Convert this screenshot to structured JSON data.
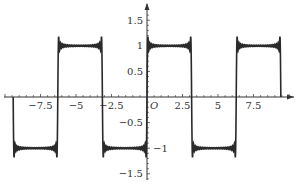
{
  "chart_data": {
    "type": "line",
    "title": "",
    "xlabel": "",
    "ylabel": "",
    "origin_label": "O",
    "xlim": [
      -10.3,
      10.5
    ],
    "ylim": [
      -1.7,
      1.8
    ],
    "x_ticks": [
      -7.5,
      -5,
      -2.5,
      2.5,
      5,
      7.5
    ],
    "x_tick_labels": [
      "−7.5",
      "−5",
      "−2.5",
      "2.5",
      "5",
      "7.5"
    ],
    "y_ticks": [
      1.5,
      1,
      0.5,
      -0.5,
      -1,
      -1.5
    ],
    "y_tick_labels": [
      "1.5",
      "1",
      "0.5",
      "−0.5",
      "−1",
      "−1.5"
    ],
    "grid": false,
    "legend": null,
    "series": [
      {
        "name": "Fourier partial sum",
        "harmonics": 25,
        "domain": [
          -9.4248,
          9.4248
        ],
        "segments": [
          {
            "x_from": -9.4248,
            "x_to": -6.2832,
            "value": -1
          },
          {
            "x_from": -6.2832,
            "x_to": -3.1416,
            "value": 1
          },
          {
            "x_from": -3.1416,
            "x_to": 0,
            "value": -1
          },
          {
            "x_from": 0,
            "x_to": 3.1416,
            "value": 1
          },
          {
            "x_from": 3.1416,
            "x_to": 6.2832,
            "value": -1
          },
          {
            "x_from": 6.2832,
            "x_to": 9.4248,
            "value": 1
          }
        ],
        "overshoot_peak": 1.18
      }
    ]
  }
}
